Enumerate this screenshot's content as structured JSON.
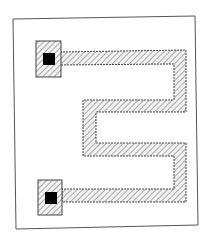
{
  "diagram": {
    "colors": {
      "background": "#ffffff",
      "frame": "#555555",
      "trace_fill": "#e8e8e8",
      "hatch": "#777777",
      "outline": "#444444",
      "contact": "#000000"
    },
    "pads": [
      {
        "name": "top-pad",
        "x": 36,
        "y": 41,
        "w": 25,
        "h": 36,
        "contact": {
          "x": 43,
          "y": 52,
          "w": 12,
          "h": 12
        }
      },
      {
        "name": "bottom-pad",
        "x": 38,
        "y": 181,
        "w": 24,
        "h": 34,
        "contact": {
          "x": 45,
          "y": 192,
          "w": 12,
          "h": 12
        }
      }
    ]
  }
}
